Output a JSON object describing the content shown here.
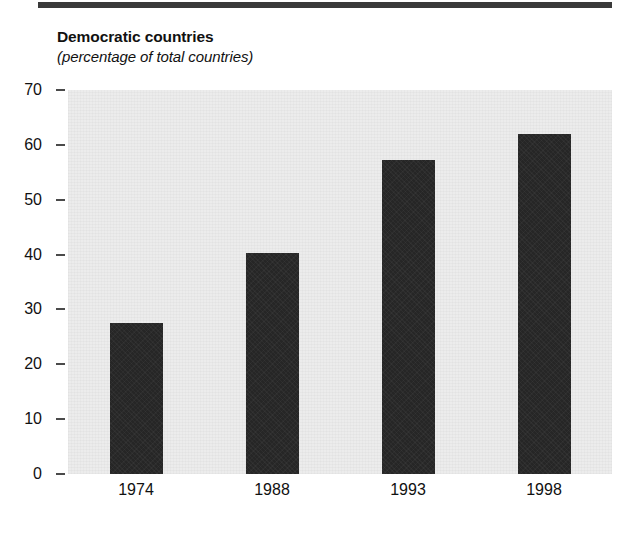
{
  "chart_data": {
    "type": "bar",
    "title": "Democratic countries",
    "subtitle": "(percentage of total countries)",
    "xlabel": "",
    "ylabel": "",
    "categories": [
      "1974",
      "1988",
      "1993",
      "1998"
    ],
    "values": [
      27.5,
      40.2,
      57.2,
      62
    ],
    "ylim": [
      0,
      70
    ],
    "yticks": [
      0,
      10,
      20,
      30,
      40,
      50,
      60,
      70
    ],
    "ytick_labels": [
      "0",
      "10",
      "20",
      "30",
      "40",
      "50",
      "60",
      "70"
    ],
    "grid": false,
    "legend": null,
    "series": [
      {
        "name": "Democratic countries",
        "values": [
          27.5,
          40.2,
          57.2,
          62
        ]
      }
    ],
    "colors": {
      "bar": "#262626",
      "plot_background": "#ececec",
      "page_background": "#ffffff",
      "rule": "#3a3a3a",
      "text": "#111111"
    }
  }
}
